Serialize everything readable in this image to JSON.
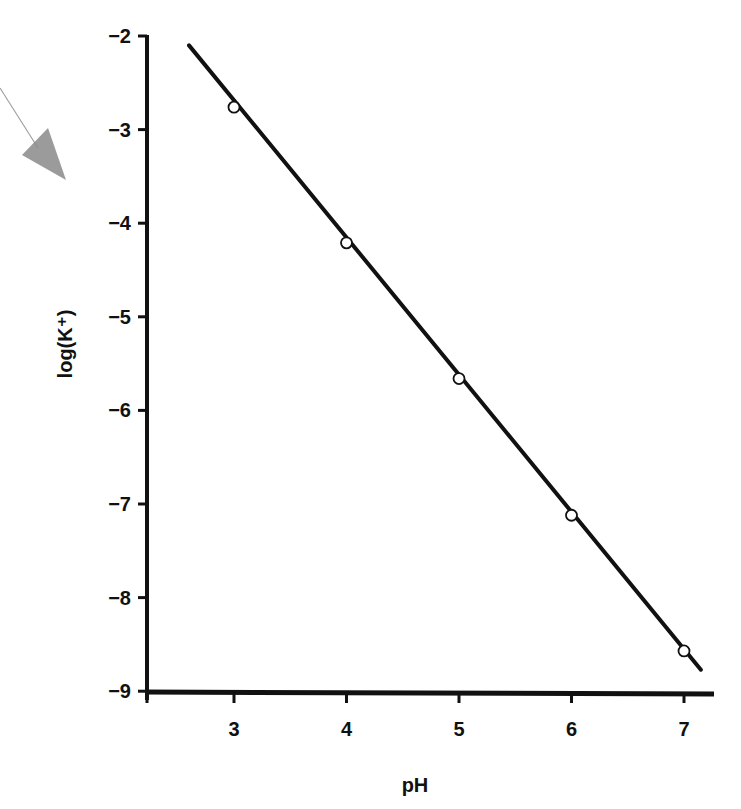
{
  "chart_data": {
    "type": "line",
    "title": "",
    "xlabel": "pH",
    "ylabel": "log(K⁺)",
    "xlim": [
      2.2,
      7.3
    ],
    "ylim": [
      -9,
      -2
    ],
    "grid": false,
    "legend": null,
    "x_ticks": [
      "3",
      "4",
      "5",
      "6",
      "7"
    ],
    "y_ticks": [
      "−2",
      "−3",
      "−4",
      "−5",
      "−6",
      "−7",
      "−8",
      "−9"
    ],
    "series": [
      {
        "name": "measured",
        "marker": "open-circle",
        "x": [
          3,
          4,
          5,
          6,
          7
        ],
        "y": [
          -2.76,
          -4.21,
          -5.66,
          -7.12,
          -8.57
        ]
      },
      {
        "name": "fit",
        "style": "solid-line",
        "x": [
          2.6,
          7.15
        ],
        "y": [
          -2.1,
          -8.77
        ],
        "slope": -1.45
      }
    ],
    "annotations": [
      {
        "type": "arrow",
        "description": "grey hand-drawn arrow pointing toward y-axis",
        "color": "#8a8a8a"
      }
    ]
  }
}
